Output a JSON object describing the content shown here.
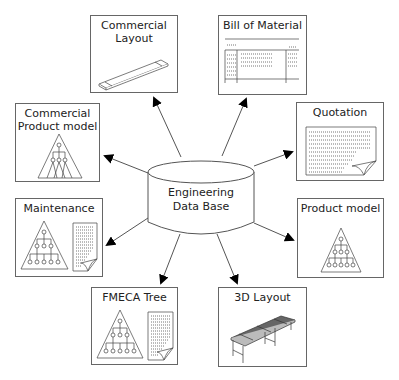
{
  "diagram": {
    "center": {
      "label_line1": "Engineering",
      "label_line2": "Data Base",
      "shape": "cylinder"
    },
    "nodes": [
      {
        "id": "commercial-layout",
        "title_line1": "Commercial",
        "title_line2": "Layout",
        "icon": "flat-bar-3d"
      },
      {
        "id": "bill-of-material",
        "title_line1": "Bill of Material",
        "icon": "table-document"
      },
      {
        "id": "commercial-product-model",
        "title_line1": "Commercial",
        "title_line2": "Product model",
        "icon": "tree-triangle"
      },
      {
        "id": "quotation",
        "title_line1": "Quotation",
        "icon": "curled-document"
      },
      {
        "id": "maintenance",
        "title_line1": "Maintenance",
        "icon": "tree-triangle-with-document"
      },
      {
        "id": "product-model",
        "title_line1": "Product model",
        "icon": "tree-triangle"
      },
      {
        "id": "fmeca-tree",
        "title_line1": "FMECA Tree",
        "icon": "tree-triangle-with-document"
      },
      {
        "id": "3d-layout",
        "title_line1": "3D Layout",
        "icon": "conveyor-3d"
      }
    ],
    "edges": [
      {
        "from": "center",
        "to": "commercial-layout",
        "direction": "outward"
      },
      {
        "from": "center",
        "to": "bill-of-material",
        "direction": "outward"
      },
      {
        "from": "center",
        "to": "commercial-product-model",
        "direction": "outward"
      },
      {
        "from": "center",
        "to": "quotation",
        "direction": "outward"
      },
      {
        "from": "center",
        "to": "maintenance",
        "direction": "outward"
      },
      {
        "from": "center",
        "to": "product-model",
        "direction": "outward"
      },
      {
        "from": "center",
        "to": "fmeca-tree",
        "direction": "outward"
      },
      {
        "from": "center",
        "to": "3d-layout",
        "direction": "outward"
      }
    ],
    "colors": {
      "line": "#555555",
      "arrowhead": "#000000",
      "box_border": "#666666",
      "text": "#222222"
    }
  }
}
